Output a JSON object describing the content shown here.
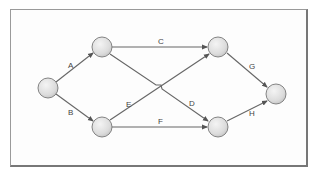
{
  "diagram": {
    "type": "network-activity-diagram",
    "nodes": [
      {
        "id": "n1",
        "cx": 48,
        "cy": 88
      },
      {
        "id": "n2",
        "cx": 102,
        "cy": 47
      },
      {
        "id": "n3",
        "cx": 102,
        "cy": 127
      },
      {
        "id": "n4",
        "cx": 218,
        "cy": 47
      },
      {
        "id": "n5",
        "cx": 218,
        "cy": 127
      },
      {
        "id": "n6",
        "cx": 276,
        "cy": 94
      }
    ],
    "edges": [
      {
        "label": "A",
        "from": "n1",
        "to": "n2"
      },
      {
        "label": "B",
        "from": "n1",
        "to": "n3"
      },
      {
        "label": "C",
        "from": "n2",
        "to": "n4"
      },
      {
        "label": "D",
        "from": "n2",
        "to": "n5"
      },
      {
        "label": "E",
        "from": "n3",
        "to": "n4"
      },
      {
        "label": "F",
        "from": "n3",
        "to": "n5"
      },
      {
        "label": "G",
        "from": "n4",
        "to": "n6"
      },
      {
        "label": "H",
        "from": "n5",
        "to": "n6"
      }
    ],
    "labels": {
      "A": "A",
      "B": "B",
      "C": "C",
      "D": "D",
      "E": "E",
      "F": "F",
      "G": "G",
      "H": "H"
    }
  }
}
